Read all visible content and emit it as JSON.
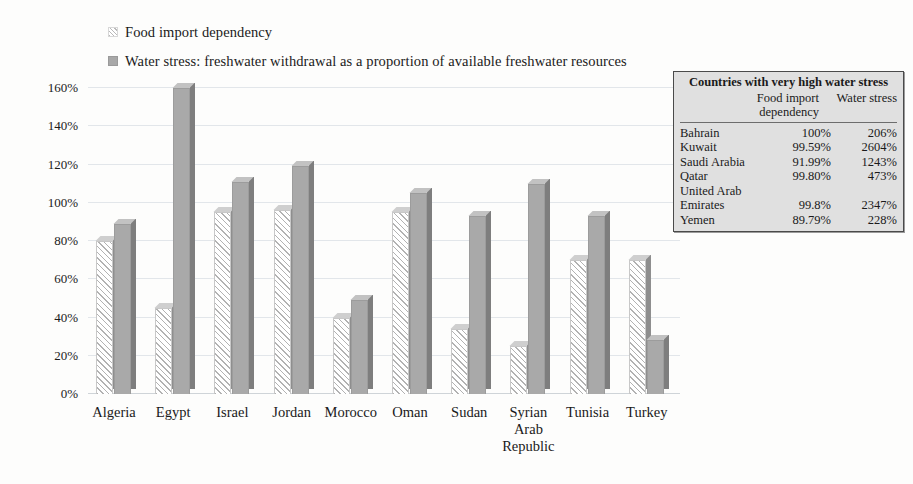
{
  "legend": {
    "items": [
      {
        "label": "Food import dependency",
        "swatch": "hatched-swatch-icon"
      },
      {
        "label": "Water stress: freshwater withdrawal as a proportion of available freshwater resources",
        "swatch": "gray-swatch-icon"
      }
    ]
  },
  "chart_data": {
    "type": "bar",
    "title": "",
    "xlabel": "",
    "ylabel": "",
    "ylim": [
      0,
      160
    ],
    "ytick_labels": [
      "0%",
      "20%",
      "40%",
      "60%",
      "80%",
      "100%",
      "120%",
      "140%",
      "160%"
    ],
    "ytick_values": [
      0,
      20,
      40,
      60,
      80,
      100,
      120,
      140,
      160
    ],
    "grid": true,
    "legend_position": "top-left",
    "categories": [
      "Algeria",
      "Egypt",
      "Israel",
      "Jordan",
      "Morocco",
      "Oman",
      "Sudan",
      "Syrian Arab Republic",
      "Tunisia",
      "Turkey"
    ],
    "series": [
      {
        "name": "Food import dependency",
        "values": [
          80,
          45,
          95,
          96,
          40,
          95,
          34,
          25,
          70,
          70
        ]
      },
      {
        "name": "Water stress: freshwater withdrawal as a proportion of available freshwater resources",
        "values": [
          89,
          160,
          111,
          119,
          49,
          105,
          93,
          110,
          93,
          28
        ]
      }
    ]
  },
  "table": {
    "title": "Countries with very high water stress",
    "columns": [
      "",
      "Food import dependency",
      "Water stress"
    ],
    "column_header_lines": {
      "col2_line1": "Food import",
      "col2_line2": "dependency",
      "col3": "Water stress"
    },
    "rows": [
      {
        "country": "Bahrain",
        "food_import_dependency": "100%",
        "water_stress": "206%"
      },
      {
        "country": "Kuwait",
        "food_import_dependency": "99.59%",
        "water_stress": "2604%"
      },
      {
        "country": "Saudi Arabia",
        "food_import_dependency": "91.99%",
        "water_stress": "1243%"
      },
      {
        "country": "Qatar",
        "food_import_dependency": "99.80%",
        "water_stress": "473%"
      },
      {
        "country": "United Arab Emirates",
        "country_line1": "United Arab",
        "country_line2": "Emirates",
        "food_import_dependency": "99.8%",
        "water_stress": "2347%"
      },
      {
        "country": "Yemen",
        "food_import_dependency": "89.79%",
        "water_stress": "228%"
      }
    ]
  }
}
